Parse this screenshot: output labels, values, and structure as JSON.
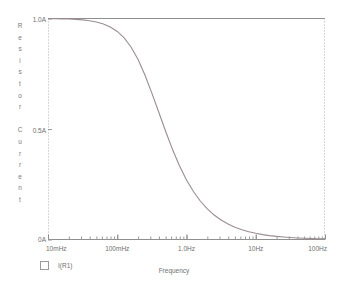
{
  "chart_data": {
    "type": "line",
    "title": "",
    "xlabel": "Frequency",
    "ylabel": "Resistor Current",
    "xscale": "log",
    "xlim": [
      0.01,
      100
    ],
    "ylim": [
      0,
      1
    ],
    "grid": false,
    "legend_position": "bottom-left",
    "x_ticks": [
      {
        "value": 0.01,
        "label": "10mHz"
      },
      {
        "value": 0.1,
        "label": "100mHz"
      },
      {
        "value": 1.0,
        "label": "1.0Hz"
      },
      {
        "value": 10,
        "label": "10Hz"
      },
      {
        "value": 100,
        "label": "100Hz"
      }
    ],
    "y_ticks": [
      {
        "value": 1.0,
        "label": "1.0A"
      },
      {
        "value": 0.5,
        "label": "0.5A"
      },
      {
        "value": 0.0,
        "label": "0A"
      }
    ],
    "series": [
      {
        "name": "I(R1)",
        "color": "#9b8d93",
        "cutoff_frequency_hz": 0.28,
        "x": [
          0.01,
          0.0126,
          0.0158,
          0.02,
          0.0251,
          0.0316,
          0.0398,
          0.0501,
          0.0631,
          0.0794,
          0.1,
          0.126,
          0.158,
          0.2,
          0.251,
          0.316,
          0.398,
          0.501,
          0.631,
          0.794,
          1.0,
          1.26,
          1.58,
          2.0,
          2.51,
          3.16,
          3.98,
          5.01,
          6.31,
          7.94,
          10.0,
          12.6,
          15.8,
          20.0,
          25.1,
          31.6,
          39.8,
          50.1,
          63.1,
          79.4,
          100.0
        ],
        "y": [
          0.9994,
          0.999,
          0.9984,
          0.9975,
          0.996,
          0.9937,
          0.99,
          0.9843,
          0.9754,
          0.9618,
          0.9415,
          0.9122,
          0.8712,
          0.8144,
          0.7443,
          0.6625,
          0.5755,
          0.4884,
          0.4057,
          0.3322,
          0.2692,
          0.2172,
          0.1742,
          0.1389,
          0.1106,
          0.0882,
          0.0701,
          0.0558,
          0.0443,
          0.0352,
          0.028,
          0.0222,
          0.0177,
          0.014,
          0.0112,
          0.0089,
          0.007,
          0.0056,
          0.0044,
          0.0035,
          0.0028
        ]
      }
    ]
  },
  "axes": {
    "y_title_letters": [
      "R",
      "e",
      "s",
      "i",
      "s",
      "t",
      "o",
      "r",
      "",
      "C",
      "u",
      "r",
      "r",
      "e",
      "n",
      "t"
    ],
    "frame_color": "#8f8f8f",
    "tick_color": "#9a9a9a",
    "text_color": "#6f6f6f"
  },
  "legend": {
    "marker": "empty-square-marker",
    "label": "I(R1)"
  }
}
